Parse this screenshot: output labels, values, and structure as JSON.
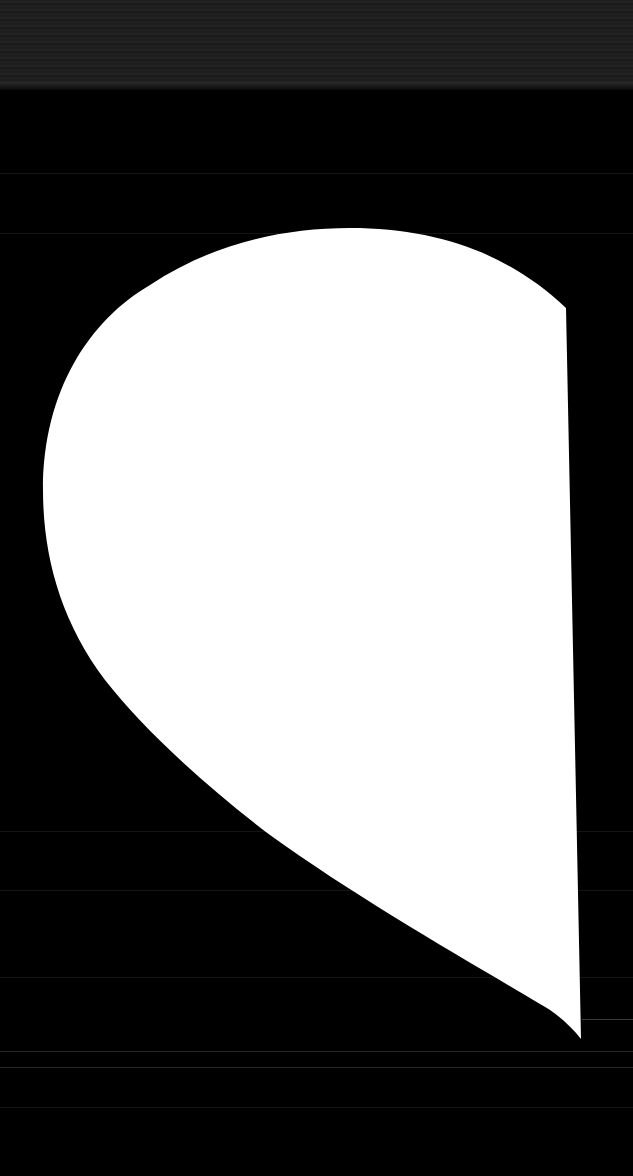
{
  "scene": {
    "description": "Abstract white half-heart shape on a black background",
    "background_color": "#000000",
    "top_band_color": "#1e1e1e",
    "shape_fill_color": "#ffffff",
    "scanline_color": "#141414"
  }
}
